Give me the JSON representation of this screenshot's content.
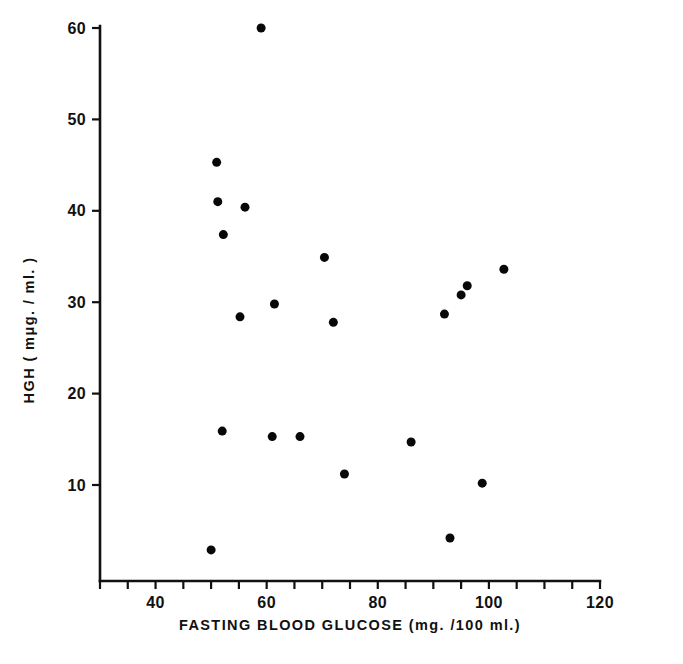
{
  "chart_data": {
    "type": "scatter",
    "title": "",
    "xlabel": "FASTING  BLOOD  GLUCOSE  (mg. /100 ml.)",
    "ylabel": "HGH ( mμg. / ml. )",
    "xlim": [
      30,
      120
    ],
    "ylim": [
      0,
      60
    ],
    "xticks": [
      40,
      60,
      80,
      100,
      120
    ],
    "xtick_labels": [
      "40",
      "60",
      "80",
      "100",
      "120"
    ],
    "yticks": [
      10,
      20,
      30,
      40,
      50,
      60
    ],
    "ytick_labels": [
      "10",
      "20",
      "30",
      "40",
      "50",
      "60"
    ],
    "x_minor_ticks": [
      30,
      35,
      40,
      45,
      50,
      55,
      60,
      65,
      70,
      75,
      80,
      85,
      90,
      95,
      100,
      105,
      110,
      115,
      120
    ],
    "grid": false,
    "legend": null,
    "marker": "filled-circle",
    "marker_color": "#080808",
    "marker_size": 6,
    "n_points": 20,
    "points": [
      {
        "x": 59.0,
        "y": 60.0
      },
      {
        "x": 51.0,
        "y": 45.3
      },
      {
        "x": 51.2,
        "y": 41.0
      },
      {
        "x": 56.1,
        "y": 40.4
      },
      {
        "x": 52.2,
        "y": 37.4
      },
      {
        "x": 70.4,
        "y": 34.9
      },
      {
        "x": 102.7,
        "y": 33.6
      },
      {
        "x": 96.1,
        "y": 31.8
      },
      {
        "x": 95.0,
        "y": 30.8
      },
      {
        "x": 61.4,
        "y": 29.8
      },
      {
        "x": 55.2,
        "y": 28.4
      },
      {
        "x": 92.0,
        "y": 28.7
      },
      {
        "x": 72.0,
        "y": 27.8
      },
      {
        "x": 52.0,
        "y": 15.9
      },
      {
        "x": 61.0,
        "y": 15.3
      },
      {
        "x": 66.0,
        "y": 15.3
      },
      {
        "x": 86.0,
        "y": 14.7
      },
      {
        "x": 74.0,
        "y": 11.2
      },
      {
        "x": 98.8,
        "y": 10.2
      },
      {
        "x": 93.0,
        "y": 4.2
      },
      {
        "x": 50.0,
        "y": 2.9
      }
    ]
  },
  "axes": {
    "x_axis_name": "fasting-blood-glucose-axis",
    "y_axis_name": "hgh-axis"
  }
}
